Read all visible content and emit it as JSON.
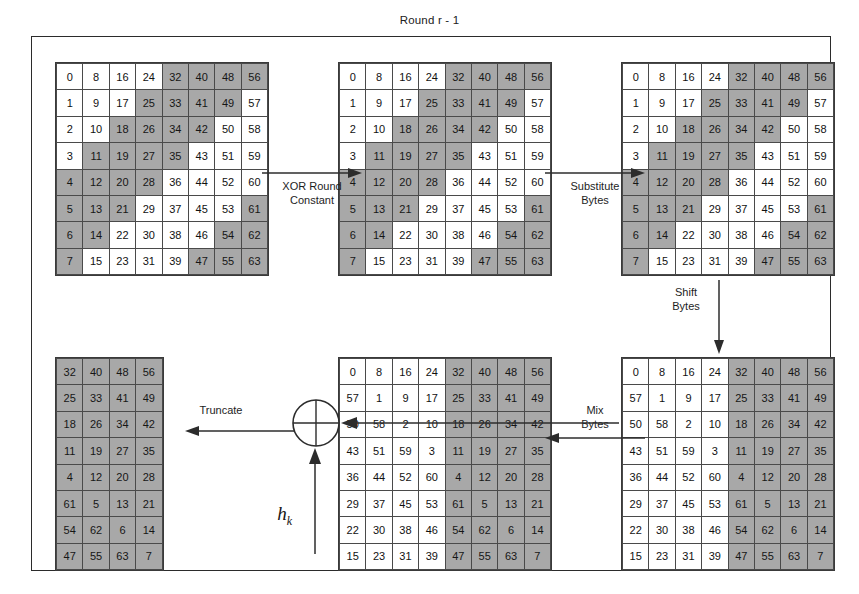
{
  "diagram": {
    "title": "Round r - 1",
    "domain": "cryptographic-hash-round-diagram"
  },
  "colors": {
    "shaded_cell": "#a8a8a8",
    "plain_cell": "#ffffff",
    "line": "#3a3a3a",
    "text": "#111111"
  },
  "arrows": {
    "xor_round_constant": "XOR Round\nConstant",
    "substitute_bytes": "Substitute\nBytes",
    "shift_bytes": "Shift\nBytes",
    "mix_bytes": "Mix\nBytes",
    "truncate": "Truncate"
  },
  "xor_node": {
    "symbol": "xor-circle",
    "input_label": "h",
    "input_subscript": "k"
  },
  "matrices": {
    "initial": {
      "name": "Initial state",
      "rows": 8,
      "cols": 8,
      "values": [
        [
          0,
          8,
          16,
          24,
          32,
          40,
          48,
          56
        ],
        [
          1,
          9,
          17,
          25,
          33,
          41,
          49,
          57
        ],
        [
          2,
          10,
          18,
          26,
          34,
          42,
          50,
          58
        ],
        [
          3,
          11,
          19,
          27,
          35,
          43,
          51,
          59
        ],
        [
          4,
          12,
          20,
          28,
          36,
          44,
          52,
          60
        ],
        [
          5,
          13,
          21,
          29,
          37,
          45,
          53,
          61
        ],
        [
          6,
          14,
          22,
          30,
          38,
          46,
          54,
          62
        ],
        [
          7,
          15,
          23,
          31,
          39,
          47,
          55,
          63
        ]
      ],
      "shaded": [
        [
          0,
          0,
          0,
          0,
          1,
          1,
          1,
          1
        ],
        [
          0,
          0,
          0,
          1,
          1,
          1,
          1,
          0
        ],
        [
          0,
          0,
          1,
          1,
          1,
          1,
          0,
          0
        ],
        [
          0,
          1,
          1,
          1,
          1,
          0,
          0,
          0
        ],
        [
          1,
          1,
          1,
          1,
          0,
          0,
          0,
          0
        ],
        [
          1,
          1,
          1,
          0,
          0,
          0,
          0,
          1
        ],
        [
          1,
          1,
          0,
          0,
          0,
          0,
          1,
          1
        ],
        [
          1,
          0,
          0,
          0,
          0,
          1,
          1,
          1
        ]
      ]
    },
    "xored": {
      "name": "After XOR Round Constant",
      "rows": 8,
      "cols": 8,
      "values": [
        [
          0,
          8,
          16,
          24,
          32,
          40,
          48,
          56
        ],
        [
          1,
          9,
          17,
          25,
          33,
          41,
          49,
          57
        ],
        [
          2,
          10,
          18,
          26,
          34,
          42,
          50,
          58
        ],
        [
          3,
          11,
          19,
          27,
          35,
          43,
          51,
          59
        ],
        [
          4,
          12,
          20,
          28,
          36,
          44,
          52,
          60
        ],
        [
          5,
          13,
          21,
          29,
          37,
          45,
          53,
          61
        ],
        [
          6,
          14,
          22,
          30,
          38,
          46,
          54,
          62
        ],
        [
          7,
          15,
          23,
          31,
          39,
          47,
          55,
          63
        ]
      ],
      "shaded": [
        [
          0,
          0,
          0,
          0,
          1,
          1,
          1,
          1
        ],
        [
          0,
          0,
          0,
          1,
          1,
          1,
          1,
          0
        ],
        [
          0,
          0,
          1,
          1,
          1,
          1,
          0,
          0
        ],
        [
          0,
          1,
          1,
          1,
          1,
          0,
          0,
          0
        ],
        [
          1,
          1,
          1,
          1,
          0,
          0,
          0,
          0
        ],
        [
          1,
          1,
          1,
          0,
          0,
          0,
          0,
          1
        ],
        [
          1,
          1,
          0,
          0,
          0,
          0,
          1,
          1
        ],
        [
          1,
          0,
          0,
          0,
          0,
          1,
          1,
          1
        ]
      ]
    },
    "substituted": {
      "name": "After Substitute Bytes",
      "rows": 8,
      "cols": 8,
      "values": [
        [
          0,
          8,
          16,
          24,
          32,
          40,
          48,
          56
        ],
        [
          1,
          9,
          17,
          25,
          33,
          41,
          49,
          57
        ],
        [
          2,
          10,
          18,
          26,
          34,
          42,
          50,
          58
        ],
        [
          3,
          11,
          19,
          27,
          35,
          43,
          51,
          59
        ],
        [
          4,
          12,
          20,
          28,
          36,
          44,
          52,
          60
        ],
        [
          5,
          13,
          21,
          29,
          37,
          45,
          53,
          61
        ],
        [
          6,
          14,
          22,
          30,
          38,
          46,
          54,
          62
        ],
        [
          7,
          15,
          23,
          31,
          39,
          47,
          55,
          63
        ]
      ],
      "shaded": [
        [
          0,
          0,
          0,
          0,
          1,
          1,
          1,
          1
        ],
        [
          0,
          0,
          0,
          1,
          1,
          1,
          1,
          0
        ],
        [
          0,
          0,
          1,
          1,
          1,
          1,
          0,
          0
        ],
        [
          0,
          1,
          1,
          1,
          1,
          0,
          0,
          0
        ],
        [
          1,
          1,
          1,
          1,
          0,
          0,
          0,
          0
        ],
        [
          1,
          1,
          1,
          0,
          0,
          0,
          0,
          1
        ],
        [
          1,
          1,
          0,
          0,
          0,
          0,
          1,
          1
        ],
        [
          1,
          0,
          0,
          0,
          0,
          1,
          1,
          1
        ]
      ]
    },
    "shifted": {
      "name": "After Shift Bytes",
      "rows": 8,
      "cols": 8,
      "values": [
        [
          0,
          8,
          16,
          24,
          32,
          40,
          48,
          56
        ],
        [
          57,
          1,
          9,
          17,
          25,
          33,
          41,
          49
        ],
        [
          50,
          58,
          2,
          10,
          18,
          26,
          34,
          42
        ],
        [
          43,
          51,
          59,
          3,
          11,
          19,
          27,
          35
        ],
        [
          36,
          44,
          52,
          60,
          4,
          12,
          20,
          28
        ],
        [
          29,
          37,
          45,
          53,
          61,
          5,
          13,
          21
        ],
        [
          22,
          30,
          38,
          46,
          54,
          62,
          6,
          14
        ],
        [
          15,
          23,
          31,
          39,
          47,
          55,
          63,
          7
        ]
      ],
      "shaded": [
        [
          0,
          0,
          0,
          0,
          1,
          1,
          1,
          1
        ],
        [
          0,
          0,
          0,
          0,
          1,
          1,
          1,
          1
        ],
        [
          0,
          0,
          0,
          0,
          1,
          1,
          1,
          1
        ],
        [
          0,
          0,
          0,
          0,
          1,
          1,
          1,
          1
        ],
        [
          0,
          0,
          0,
          0,
          1,
          1,
          1,
          1
        ],
        [
          0,
          0,
          0,
          0,
          1,
          1,
          1,
          1
        ],
        [
          0,
          0,
          0,
          0,
          1,
          1,
          1,
          1
        ],
        [
          0,
          0,
          0,
          0,
          1,
          1,
          1,
          1
        ]
      ]
    },
    "mixed": {
      "name": "After Mix Bytes",
      "rows": 8,
      "cols": 8,
      "values": [
        [
          0,
          8,
          16,
          24,
          32,
          40,
          48,
          56
        ],
        [
          57,
          1,
          9,
          17,
          25,
          33,
          41,
          49
        ],
        [
          50,
          58,
          2,
          10,
          18,
          26,
          34,
          42
        ],
        [
          43,
          51,
          59,
          3,
          11,
          19,
          27,
          35
        ],
        [
          36,
          44,
          52,
          60,
          4,
          12,
          20,
          28
        ],
        [
          29,
          37,
          45,
          53,
          61,
          5,
          13,
          21
        ],
        [
          22,
          30,
          38,
          46,
          54,
          62,
          6,
          14
        ],
        [
          15,
          23,
          31,
          39,
          47,
          55,
          63,
          7
        ]
      ],
      "shaded": [
        [
          0,
          0,
          0,
          0,
          1,
          1,
          1,
          1
        ],
        [
          0,
          0,
          0,
          0,
          1,
          1,
          1,
          1
        ],
        [
          0,
          0,
          0,
          0,
          1,
          1,
          1,
          1
        ],
        [
          0,
          0,
          0,
          0,
          1,
          1,
          1,
          1
        ],
        [
          0,
          0,
          0,
          0,
          1,
          1,
          1,
          1
        ],
        [
          0,
          0,
          0,
          0,
          1,
          1,
          1,
          1
        ],
        [
          0,
          0,
          0,
          0,
          1,
          1,
          1,
          1
        ],
        [
          0,
          0,
          0,
          0,
          1,
          1,
          1,
          1
        ]
      ]
    },
    "truncated": {
      "name": "After Truncate",
      "rows": 8,
      "cols": 4,
      "values": [
        [
          32,
          40,
          48,
          56
        ],
        [
          25,
          33,
          41,
          49
        ],
        [
          18,
          26,
          34,
          42
        ],
        [
          11,
          19,
          27,
          35
        ],
        [
          4,
          12,
          20,
          28
        ],
        [
          61,
          5,
          13,
          21
        ],
        [
          54,
          62,
          6,
          14
        ],
        [
          47,
          55,
          63,
          7
        ]
      ],
      "shaded": [
        [
          1,
          1,
          1,
          1
        ],
        [
          1,
          1,
          1,
          1
        ],
        [
          1,
          1,
          1,
          1
        ],
        [
          1,
          1,
          1,
          1
        ],
        [
          1,
          1,
          1,
          1
        ],
        [
          1,
          1,
          1,
          1
        ],
        [
          1,
          1,
          1,
          1
        ],
        [
          1,
          1,
          1,
          1
        ]
      ]
    }
  }
}
